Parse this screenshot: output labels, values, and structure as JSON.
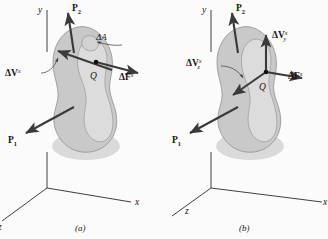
{
  "figure": {
    "title_visible": false,
    "panels": [
      {
        "id": "a",
        "caption": "(a)",
        "axes": {
          "y_label": "y",
          "x_label": "x",
          "z_label": "z"
        },
        "point_label": "Q",
        "labels": {
          "p2_base": "P",
          "p2_sub": "2",
          "p1_base": "P",
          "p1_sub": "1",
          "delta_area": "ΔA",
          "delta_v_base": "ΔV",
          "delta_v_sup": "x",
          "delta_f_base": "ΔF",
          "delta_f_sup": "x"
        }
      },
      {
        "id": "b",
        "caption": "(b)",
        "axes": {
          "y_label": "y",
          "x_label": "x",
          "z_label": "z"
        },
        "point_label": "Q",
        "labels": {
          "p2_base": "P",
          "p2_sub": "2",
          "p1_base": "P",
          "p1_sub": "1",
          "delta_vy_base": "ΔV",
          "delta_vy_sup": "x",
          "delta_vy_sub": "y",
          "delta_vz_base": "ΔV",
          "delta_vz_sup": "x",
          "delta_vz_sub": "z",
          "delta_f_base": "ΔF",
          "delta_f_sup": "x"
        }
      }
    ],
    "colors": {
      "background": "#fbfbfb",
      "body_fill": "#c9c9c9",
      "body_inner_fill": "#dcdcdc",
      "stroke": "#3a3a3a",
      "text": "#151515"
    }
  }
}
